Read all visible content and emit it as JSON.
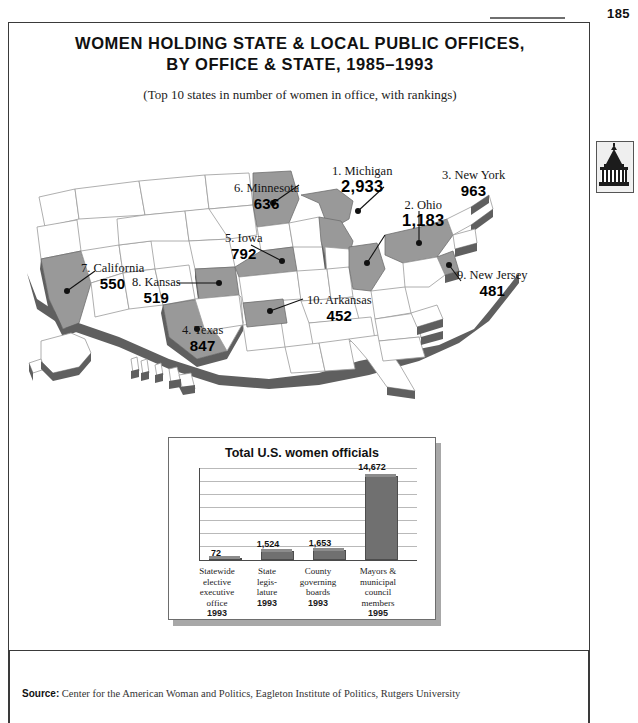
{
  "page": {
    "number": "185",
    "source_label": "Source:",
    "source_text": " Center for the American Woman and Politics, Eagleton Institute of Politics, Rutgers University",
    "thumb_tab_icon": "capitol-building-icon"
  },
  "figure": {
    "title_line1": "WOMEN HOLDING STATE & LOCAL PUBLIC OFFICES,",
    "title_line2": "BY OFFICE & STATE, 1985–1993",
    "subtitle": "(Top 10 states in number of women in office, with rankings)"
  },
  "map": {
    "highlight_color": "#999999",
    "base_color": "#ffffff",
    "extrude_color": "#5f5f5f",
    "callouts": [
      {
        "rank": "1.",
        "state": "Michigan",
        "label": "1. Michigan",
        "value": "2,933"
      },
      {
        "rank": "2.",
        "state": "Ohio",
        "label": "2. Ohio",
        "value": "1,183"
      },
      {
        "rank": "3.",
        "state": "New York",
        "label": "3. New York",
        "value": "963"
      },
      {
        "rank": "4.",
        "state": "Texas",
        "label": "4. Texas",
        "value": "847"
      },
      {
        "rank": "5.",
        "state": "Iowa",
        "label": "5. Iowa",
        "value": "792"
      },
      {
        "rank": "6.",
        "state": "Minnesota",
        "label": "6. Minnesota",
        "value": "636"
      },
      {
        "rank": "7.",
        "state": "California",
        "label": "7. California",
        "value": "550"
      },
      {
        "rank": "8.",
        "state": "Kansas",
        "label": "8. Kansas",
        "value": "519"
      },
      {
        "rank": "9.",
        "state": "New Jersey",
        "label": "9. New Jersey",
        "value": "481"
      },
      {
        "rank": "10.",
        "state": "Arkansas",
        "label": "10. Arkansas",
        "value": "452"
      }
    ]
  },
  "chart_data": {
    "type": "bar",
    "title": "Total U.S. women officials",
    "xlabel": "",
    "ylabel": "",
    "ylim": [
      0,
      16000
    ],
    "grid": true,
    "legend": "none",
    "categories": [
      "Statewide elective executive office 1993",
      "State legis-lature 1993",
      "County governing boards 1993",
      "Mayors & municipal council members 1995"
    ],
    "category_lines": [
      [
        "Statewide",
        "elective",
        "executive",
        "office"
      ],
      [
        "State",
        "legis-",
        "lature"
      ],
      [
        "County",
        "governing",
        "boards"
      ],
      [
        "Mayors &",
        "municipal",
        "council",
        "members"
      ]
    ],
    "category_years": [
      "1993",
      "1993",
      "1993",
      "1995"
    ],
    "values": [
      72,
      1524,
      1653,
      14672
    ],
    "value_labels": [
      "72",
      "1,524",
      "1,653",
      "14,672"
    ],
    "bar_color": "#707070"
  }
}
